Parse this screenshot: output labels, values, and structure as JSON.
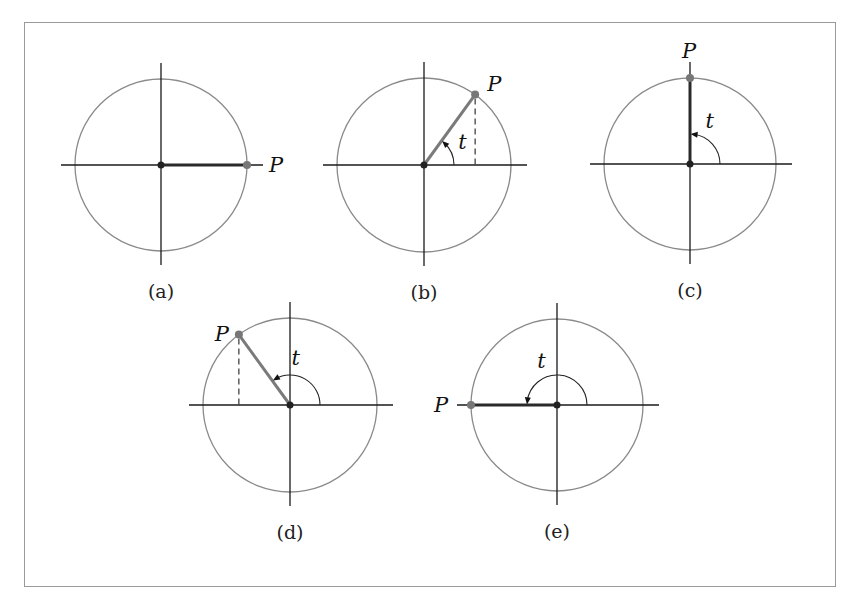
{
  "figure": {
    "frame_color": "#9a9a9a",
    "colors": {
      "circle": "#8a8a8a",
      "axis": "#1a1a1a",
      "radius_segment": "#7a7a7a",
      "point": "#777777",
      "dashed": "#333333"
    },
    "panels": [
      {
        "id": "a",
        "caption": "(a)",
        "point_label": "P",
        "angle_label": "",
        "angle_deg": 0,
        "cx": 161,
        "cy": 165,
        "r": 86,
        "show_arc": false,
        "dashed": false,
        "label_dx": 22,
        "label_dy": 7
      },
      {
        "id": "b",
        "caption": "(b)",
        "point_label": "P",
        "angle_label": "t",
        "angle_deg": 54,
        "cx": 424,
        "cy": 165,
        "r": 87,
        "show_arc": true,
        "dashed": true,
        "label_dx": 12,
        "label_dy": -4
      },
      {
        "id": "c",
        "caption": "(c)",
        "point_label": "P",
        "angle_label": "t",
        "angle_deg": 90,
        "cx": 690,
        "cy": 164,
        "r": 86,
        "show_arc": true,
        "dashed": false,
        "label_dx": -8,
        "label_dy": -20
      },
      {
        "id": "d",
        "caption": "(d)",
        "point_label": "P",
        "angle_label": "t",
        "angle_deg": 126,
        "cx": 290,
        "cy": 405,
        "r": 87,
        "show_arc": true,
        "dashed": true,
        "label_dx": -24,
        "label_dy": 6
      },
      {
        "id": "e",
        "caption": "(e)",
        "point_label": "P",
        "angle_label": "t",
        "angle_deg": 180,
        "cx": 557,
        "cy": 405,
        "r": 86,
        "show_arc": true,
        "dashed": false,
        "label_dx": -37,
        "label_dy": 7
      }
    ]
  }
}
